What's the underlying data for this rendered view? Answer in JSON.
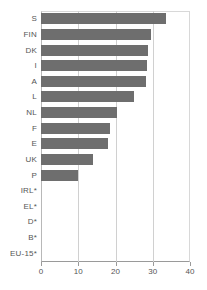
{
  "chart_data": {
    "type": "bar",
    "orientation": "horizontal",
    "title": "",
    "subtitle": "",
    "xlabel": "",
    "ylabel": "",
    "xlim": [
      0,
      40
    ],
    "xticks": [
      0,
      10,
      20,
      30,
      40
    ],
    "xtick_labels": [
      "0",
      "10",
      "20",
      "30",
      "40"
    ],
    "grid": true,
    "grid_axis": "x",
    "legend": null,
    "bar_color": "#6e6e6e",
    "categories": [
      "S",
      "FIN",
      "DK",
      "I",
      "A",
      "L",
      "NL",
      "F",
      "E",
      "UK",
      "P",
      "IRL*",
      "EL*",
      "D*",
      "B*",
      "EU-15*"
    ],
    "values": [
      33.6,
      29.5,
      28.7,
      28.5,
      28.2,
      25.0,
      20.4,
      18.5,
      18.0,
      14.0,
      10.0,
      0,
      0,
      0,
      0,
      0
    ],
    "bars": [
      {
        "category": "S",
        "value": 33.6
      },
      {
        "category": "FIN",
        "value": 29.5
      },
      {
        "category": "DK",
        "value": 28.7
      },
      {
        "category": "I",
        "value": 28.5
      },
      {
        "category": "A",
        "value": 28.2
      },
      {
        "category": "L",
        "value": 25.0
      },
      {
        "category": "NL",
        "value": 20.4
      },
      {
        "category": "F",
        "value": 18.5
      },
      {
        "category": "E",
        "value": 18.0
      },
      {
        "category": "UK",
        "value": 14.0
      },
      {
        "category": "P",
        "value": 10.0
      },
      {
        "category": "IRL*",
        "value": 0
      },
      {
        "category": "EL*",
        "value": 0
      },
      {
        "category": "D*",
        "value": 0
      },
      {
        "category": "B*",
        "value": 0
      },
      {
        "category": "EU-15*",
        "value": 0
      }
    ]
  }
}
